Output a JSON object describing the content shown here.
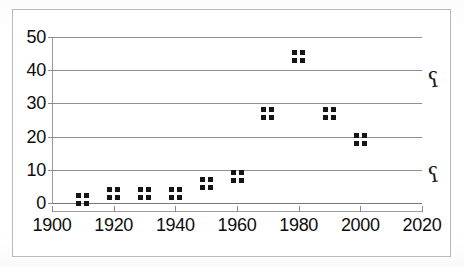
{
  "figure": {
    "frame_border_color": "#b9b9b9",
    "background_color": "#ffffff",
    "marker_color": "#151515",
    "gridline_color": "#8f8f8f"
  },
  "artifacts": {
    "glyph_upper": "ʕ",
    "glyph_lower": "ʕ",
    "glyph_name": "scan-artifact-question-mark"
  },
  "chart_data": {
    "type": "scatter",
    "title": "",
    "subtitle": "",
    "xlabel": "",
    "ylabel": "",
    "xlim": [
      1900,
      2020
    ],
    "ylim": [
      0,
      50
    ],
    "xticks": [
      1900,
      1920,
      1940,
      1960,
      1980,
      2000,
      2020
    ],
    "xtick_labels": [
      "1900",
      "1920",
      "1940",
      "1960",
      "1980",
      "2000",
      "2020"
    ],
    "yticks": [
      0,
      10,
      20,
      30,
      40,
      50
    ],
    "ytick_labels": [
      "0",
      "10",
      "20",
      "30",
      "40",
      "50"
    ],
    "grid": true,
    "grid_axis": "y",
    "legend": false,
    "legend_position": "none",
    "marker_style": "square-cluster",
    "series": [
      {
        "name": "series-1",
        "points": [
          {
            "x": 1910,
            "y": 1
          },
          {
            "x": 1920,
            "y": 3
          },
          {
            "x": 1930,
            "y": 3
          },
          {
            "x": 1940,
            "y": 3
          },
          {
            "x": 1950,
            "y": 6
          },
          {
            "x": 1960,
            "y": 8
          },
          {
            "x": 1970,
            "y": 27
          },
          {
            "x": 1980,
            "y": 44
          },
          {
            "x": 1990,
            "y": 27
          },
          {
            "x": 2000,
            "y": 19
          }
        ]
      }
    ],
    "x": [
      1910,
      1920,
      1930,
      1940,
      1950,
      1960,
      1970,
      1980,
      1990,
      2000
    ],
    "values": [
      1,
      3,
      3,
      3,
      6,
      8,
      27,
      44,
      27,
      19
    ]
  }
}
